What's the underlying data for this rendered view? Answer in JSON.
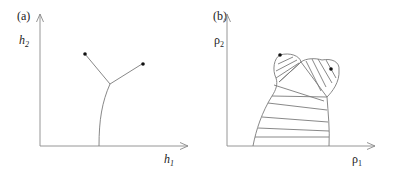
{
  "panels": [
    {
      "id": "a",
      "tag": "(a)",
      "x_axis": {
        "symbol": "h",
        "sub": "1"
      },
      "y_axis": {
        "symbol": "h",
        "sub": "2"
      },
      "description": "Y-shaped curve: a vertical stem from the h1 axis that splits into two branches ending at dots"
    },
    {
      "id": "b",
      "tag": "(b)",
      "x_axis": {
        "symbol": "ρ",
        "sub": "1"
      },
      "y_axis": {
        "symbol": "ρ",
        "sub": "2"
      },
      "description": "Region bounded by curves with two lobes at the top, filled with hatch lines; two dots on the upper boundary"
    }
  ]
}
